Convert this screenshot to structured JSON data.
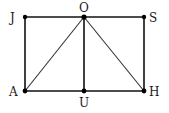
{
  "diagram": {
    "type": "geometry",
    "points": [
      {
        "name": "J",
        "x": 25,
        "y": 17,
        "label_x": 10,
        "label_y": 22
      },
      {
        "name": "O",
        "x": 84,
        "y": 17,
        "label_x": 79,
        "label_y": 12
      },
      {
        "name": "S",
        "x": 144,
        "y": 17,
        "label_x": 149,
        "label_y": 22
      },
      {
        "name": "A",
        "x": 25,
        "y": 91,
        "label_x": 9,
        "label_y": 96
      },
      {
        "name": "U",
        "x": 84,
        "y": 91,
        "label_x": 79,
        "label_y": 107
      },
      {
        "name": "H",
        "x": 144,
        "y": 91,
        "label_x": 149,
        "label_y": 96
      }
    ],
    "segments": [
      [
        "J",
        "S"
      ],
      [
        "S",
        "H"
      ],
      [
        "H",
        "A"
      ],
      [
        "A",
        "J"
      ],
      [
        "O",
        "U"
      ],
      [
        "O",
        "A"
      ],
      [
        "O",
        "H"
      ]
    ],
    "labels": {
      "J": "J",
      "O": "O",
      "S": "S",
      "A": "A",
      "U": "U",
      "H": "H"
    }
  }
}
